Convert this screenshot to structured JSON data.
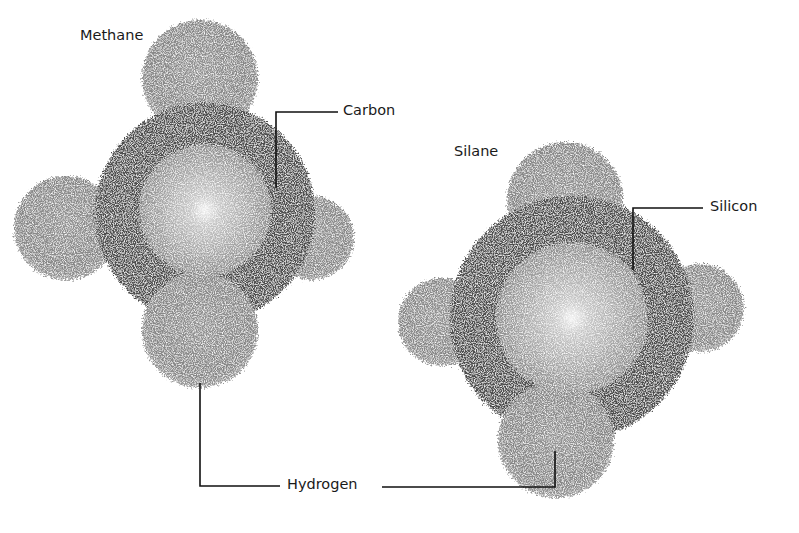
{
  "molecules": [
    {
      "id": "methane",
      "name": "Methane",
      "central_atom": "Carbon",
      "center": [
        205,
        213
      ],
      "central_radius": 66,
      "shell_radius": 112,
      "hydrogens": [
        [
          200,
          78
        ],
        [
          66,
          228
        ],
        [
          312,
          238
        ],
        [
          200,
          330
        ]
      ],
      "hydrogen_radius": 60
    },
    {
      "id": "silane",
      "name": "Silane",
      "central_atom": "Silicon",
      "center": [
        572,
        318
      ],
      "central_radius": 76,
      "shell_radius": 124,
      "hydrogens": [
        [
          565,
          205
        ],
        [
          442,
          322
        ],
        [
          700,
          308
        ],
        [
          556,
          440
        ]
      ],
      "hydrogen_radius": 60
    }
  ],
  "labels": {
    "methane": "Methane",
    "silane": "Silane",
    "carbon": "Carbon",
    "silicon": "Silicon",
    "hydrogen": "Hydrogen"
  },
  "colors": {
    "background": "#ffffff",
    "shell": "#4d4d4d",
    "hydrogen": "#8a8a8a",
    "core": "#a8a8a8",
    "core_highlight": "#f2f2f2",
    "leader_line": "#111111"
  }
}
